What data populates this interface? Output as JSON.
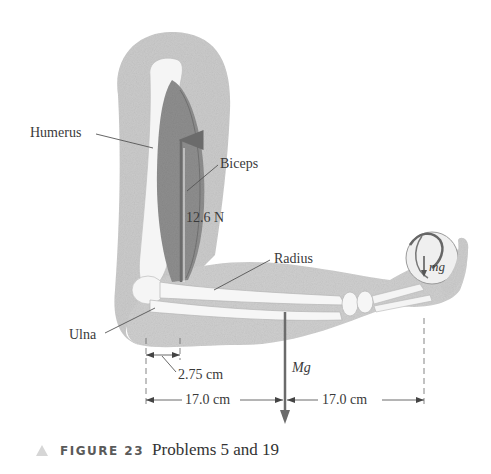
{
  "figure": {
    "labels": {
      "humerus": "Humerus",
      "biceps": "Biceps",
      "biceps_force": "12.6 N",
      "radius": "Radius",
      "ulna": "Ulna",
      "ball_weight": "mg",
      "arm_weight": "Mg",
      "dim_short": "2.75 cm",
      "dim_left": "17.0 cm",
      "dim_right": "17.0 cm"
    },
    "caption": {
      "number": "FIGURE 23",
      "text": "Problems 5 and 19"
    },
    "colors": {
      "skin": "#c9c9c9",
      "bone": "#f4f4f4",
      "muscle": "#8a8a8a",
      "arrow": "#6b6b6b",
      "text": "#3a3a3a"
    }
  }
}
